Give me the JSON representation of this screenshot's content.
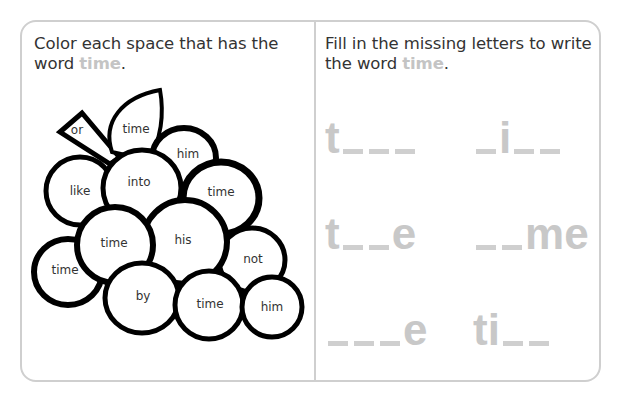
{
  "left_panel": {
    "instruction_prefix": "Color each space that has the word ",
    "keyword": "time",
    "instruction_suffix": ".",
    "grapes": [
      {
        "id": "stem",
        "label": "or"
      },
      {
        "id": "leaf",
        "label": "time"
      },
      {
        "id": "g1",
        "label": "him"
      },
      {
        "id": "g2",
        "label": "like"
      },
      {
        "id": "g3",
        "label": "into"
      },
      {
        "id": "g4",
        "label": "time"
      },
      {
        "id": "g5",
        "label": "time"
      },
      {
        "id": "g6",
        "label": "his"
      },
      {
        "id": "g7",
        "label": "time"
      },
      {
        "id": "g8",
        "label": "not"
      },
      {
        "id": "g9",
        "label": "by"
      },
      {
        "id": "g10",
        "label": "time"
      },
      {
        "id": "g11",
        "label": "him"
      }
    ]
  },
  "right_panel": {
    "instruction_prefix": "Fill in the missing letters to write the word ",
    "keyword": "time",
    "instruction_suffix": ".",
    "puzzles": [
      {
        "row": 1,
        "col": 1,
        "pattern": "t___",
        "letters": [
          "t",
          "_",
          "_",
          "_"
        ]
      },
      {
        "row": 1,
        "col": 2,
        "pattern": "_i__",
        "letters": [
          "_",
          "i",
          "_",
          "_"
        ]
      },
      {
        "row": 2,
        "col": 1,
        "pattern": "t__e",
        "letters": [
          "t",
          "_",
          "_",
          "e"
        ]
      },
      {
        "row": 2,
        "col": 2,
        "pattern": "__me",
        "letters": [
          "_",
          "_",
          "m",
          "e"
        ]
      },
      {
        "row": 3,
        "col": 1,
        "pattern": "___e",
        "letters": [
          "_",
          "_",
          "_",
          "e"
        ]
      },
      {
        "row": 3,
        "col": 2,
        "pattern": "ti__",
        "letters": [
          "t",
          "i",
          "_",
          "_"
        ]
      }
    ]
  },
  "colors": {
    "frame_border": "#cfcfcf",
    "keyword": "#c4c4c4",
    "text": "#333333",
    "outline": "#000000"
  }
}
